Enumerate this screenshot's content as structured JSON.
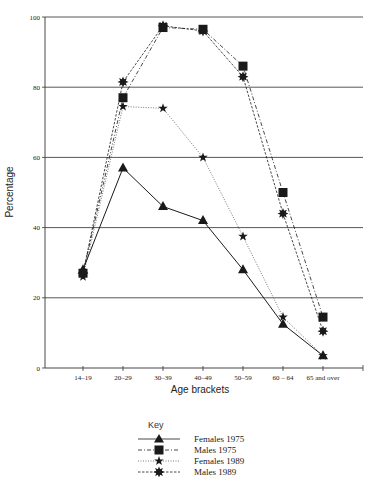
{
  "chart_data": {
    "type": "line",
    "title": "",
    "xlabel": "Age brackets",
    "ylabel": "Percentage",
    "ylim": [
      0,
      100
    ],
    "yticks": [
      0,
      20,
      40,
      60,
      80,
      100
    ],
    "grid": "horizontal",
    "categories": [
      "14–19",
      "20–29",
      "30–39",
      "40–49",
      "50–59",
      "60 – 64",
      "65 and over"
    ],
    "series": [
      {
        "name": "Females 1975",
        "marker": "triangle",
        "line": "solid",
        "color": "#1a1a1a",
        "values": [
          28,
          57,
          46,
          42,
          28,
          12.5,
          3.5
        ]
      },
      {
        "name": "Males 1975",
        "marker": "square",
        "line": "dash-dot",
        "color": "#1a1a1a",
        "values": [
          27,
          77,
          97,
          96.5,
          86,
          50,
          14.5
        ]
      },
      {
        "name": "Females 1989",
        "marker": "star",
        "line": "dotted",
        "color": "#555555",
        "values": [
          26,
          74.5,
          74,
          60,
          37.5,
          14.5,
          3.5
        ]
      },
      {
        "name": "Males 1989",
        "marker": "starburst",
        "line": "dashed",
        "color": "#1a1a1a",
        "values": [
          27,
          81.5,
          97.5,
          96,
          83,
          44,
          10.5
        ]
      }
    ],
    "legend": {
      "title": "Key",
      "position": "bottom-center"
    }
  },
  "legend": {
    "title": "Key",
    "items": [
      {
        "label": "Females  1975"
      },
      {
        "label": "Males  1975"
      },
      {
        "label": "Females  1989"
      },
      {
        "label": "Males  1989"
      }
    ]
  }
}
